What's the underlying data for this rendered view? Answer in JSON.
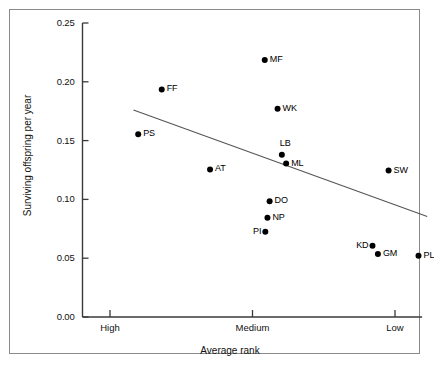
{
  "chart_data": {
    "type": "scatter",
    "title": "",
    "xlabel": "Average rank",
    "ylabel": "Surviving offspring per year",
    "xtick_labels": [
      "High",
      "Medium",
      "Low"
    ],
    "xtick_positions": [
      0.0,
      1.0,
      2.0
    ],
    "xlim": [
      -0.22,
      2.19
    ],
    "ytick_labels": [
      "0.00",
      "0.05",
      "0.10",
      "0.15",
      "0.20",
      "0.25"
    ],
    "ytick_values": [
      0.0,
      0.05,
      0.1,
      0.15,
      0.2,
      0.25
    ],
    "ylim": [
      0.0,
      0.25
    ],
    "grid": false,
    "legend": "none",
    "points": [
      {
        "label": "PS",
        "x": 0.198,
        "y": 0.1555,
        "label_side": "right"
      },
      {
        "label": "FF",
        "x": 0.363,
        "y": 0.1935,
        "label_side": "right"
      },
      {
        "label": "AT",
        "x": 0.702,
        "y": 0.1255,
        "label_side": "right"
      },
      {
        "label": "MF",
        "x": 1.086,
        "y": 0.2185,
        "label_side": "right"
      },
      {
        "label": "WK",
        "x": 1.176,
        "y": 0.177,
        "label_side": "right"
      },
      {
        "label": "LB",
        "x": 1.206,
        "y": 0.138,
        "label_side": "above"
      },
      {
        "label": "ML",
        "x": 1.236,
        "y": 0.1305,
        "label_side": "right"
      },
      {
        "label": "DO",
        "x": 1.12,
        "y": 0.0985,
        "label_side": "right"
      },
      {
        "label": "NP",
        "x": 1.105,
        "y": 0.0845,
        "label_side": "right"
      },
      {
        "label": "PI",
        "x": 1.09,
        "y": 0.0725,
        "label_side": "left"
      },
      {
        "label": "SW",
        "x": 1.955,
        "y": 0.1245,
        "label_side": "right"
      },
      {
        "label": "KD",
        "x": 1.842,
        "y": 0.0605,
        "label_side": "left"
      },
      {
        "label": "GM",
        "x": 1.88,
        "y": 0.0535,
        "label_side": "right"
      },
      {
        "label": "PL",
        "x": 2.165,
        "y": 0.052,
        "label_side": "right"
      }
    ],
    "trend_line": {
      "x_start": 0.165,
      "y_start": 0.176,
      "x_end": 2.226,
      "y_end": 0.0855
    },
    "colors": {
      "marker": "#000000",
      "axis": "#3a3a3a",
      "frame": "#8a8a8a",
      "trend": "#555555",
      "background": "#ffffff"
    }
  }
}
